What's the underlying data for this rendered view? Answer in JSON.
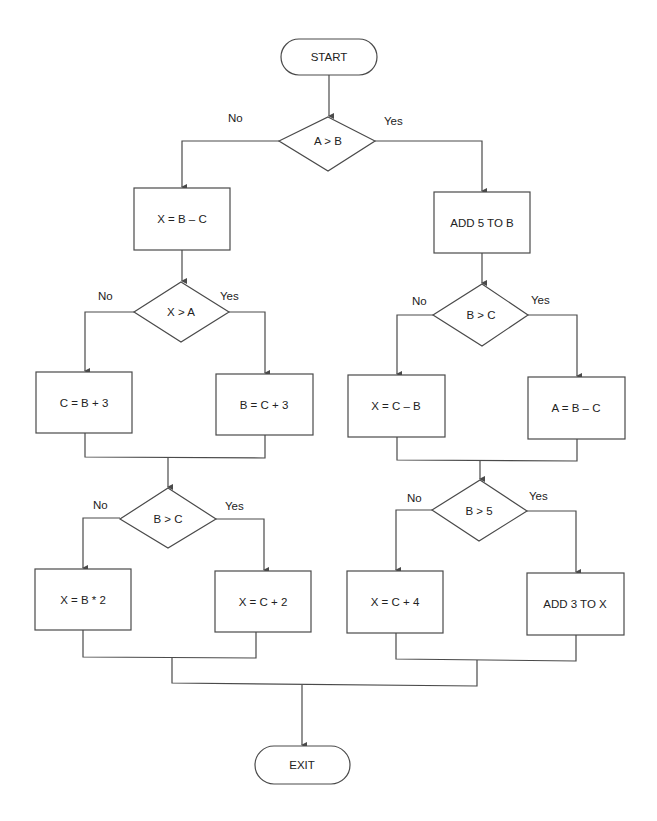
{
  "diagram": {
    "type": "flowchart",
    "terminals": {
      "start": "START",
      "exit": "EXIT"
    },
    "decisions": {
      "d1": "A > B",
      "d2": "X > A",
      "d3": "B > C",
      "d4": "B > C",
      "d5": "B > 5"
    },
    "processes": {
      "p1": "X = B – C",
      "p2": "ADD 5 TO B",
      "p3": "C = B + 3",
      "p4": "B = C + 3",
      "p5": "X = C – B",
      "p6": "A = B – C",
      "p7": "X = B * 2",
      "p8": "X = C + 2",
      "p9": "X = C + 4",
      "p10": "ADD 3 TO X"
    },
    "branch_labels": {
      "no": "No",
      "yes": "Yes"
    },
    "colors": {
      "stroke": "#4a4a4a",
      "text": "#222222",
      "background": "#ffffff"
    }
  }
}
